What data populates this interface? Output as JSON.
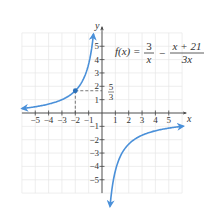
{
  "chart_data": {
    "type": "line",
    "formula": {
      "lhs": "f(x) =",
      "term1_num": "3",
      "term1_den": "x",
      "minus": "−",
      "term2_num": "x + 21",
      "term2_den": "3x"
    },
    "xlabel": "x",
    "ylabel": "y",
    "xlim": [
      -6,
      6
    ],
    "ylim": [
      -6,
      6
    ],
    "grid": true,
    "x_ticks": [
      "−5",
      "−4",
      "−3",
      "−2",
      "−1",
      "1",
      "2",
      "3",
      "4",
      "5"
    ],
    "y_ticks": [
      "5",
      "4",
      "3",
      "2",
      "1",
      "−1",
      "−2",
      "−3",
      "−4",
      "−5"
    ],
    "vertical_asymptote": 0,
    "horizontal_asymptote": -0.3333,
    "series": [
      {
        "name": "left branch",
        "x": [
          -6,
          -5,
          -4,
          -3,
          -2,
          -1.5,
          -1,
          -0.8,
          -0.64
        ],
        "y": [
          0.333,
          0.467,
          0.667,
          1.0,
          1.667,
          2.333,
          3.667,
          4.667,
          5.917
        ]
      },
      {
        "name": "right branch",
        "x": [
          0.6,
          0.8,
          1,
          1.5,
          2,
          3,
          4,
          5,
          6.1
        ],
        "y": [
          -7.0,
          -5.333,
          -4.333,
          -3.0,
          -2.333,
          -1.667,
          -1.333,
          -1.133,
          -0.989
        ]
      }
    ],
    "annotations": [
      {
        "point": [
          -2,
          1.6667
        ],
        "label_num": "5",
        "label_den": "3",
        "dashed_guides": true
      }
    ],
    "colors": {
      "curve": "#4a90d9",
      "grid": "#e6e6e6",
      "axis": "#444444"
    }
  }
}
